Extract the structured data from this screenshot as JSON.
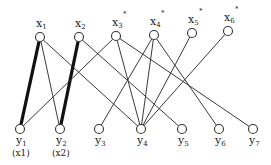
{
  "diagram": {
    "type": "bipartite-graph",
    "top_nodes": [
      {
        "id": "x1",
        "label": "x",
        "sub": "1",
        "x": 40,
        "y": 37,
        "starred": false
      },
      {
        "id": "x2",
        "label": "x",
        "sub": "2",
        "x": 79,
        "y": 37,
        "starred": false
      },
      {
        "id": "x3",
        "label": "x",
        "sub": "3",
        "x": 116,
        "y": 36,
        "starred": true
      },
      {
        "id": "x4",
        "label": "x",
        "sub": "4",
        "x": 154,
        "y": 35,
        "starred": true
      },
      {
        "id": "x5",
        "label": "x",
        "sub": "5",
        "x": 192,
        "y": 33,
        "starred": true
      },
      {
        "id": "x6",
        "label": "x",
        "sub": "6",
        "x": 228,
        "y": 31,
        "starred": true
      }
    ],
    "bottom_nodes": [
      {
        "id": "y1",
        "label": "y",
        "sub": "1",
        "x": 20,
        "y": 129,
        "caption": "(x1)"
      },
      {
        "id": "y2",
        "label": "y",
        "sub": "2",
        "x": 60,
        "y": 129,
        "caption": "(x2)"
      },
      {
        "id": "y3",
        "label": "y",
        "sub": "3",
        "x": 99,
        "y": 129,
        "caption": ""
      },
      {
        "id": "y4",
        "label": "y",
        "sub": "4",
        "x": 141,
        "y": 129,
        "caption": ""
      },
      {
        "id": "y5",
        "label": "y",
        "sub": "5",
        "x": 182,
        "y": 129,
        "caption": ""
      },
      {
        "id": "y6",
        "label": "y",
        "sub": "6",
        "x": 219,
        "y": 129,
        "caption": ""
      },
      {
        "id": "y7",
        "label": "y",
        "sub": "7",
        "x": 253,
        "y": 129,
        "caption": ""
      }
    ],
    "edges": [
      {
        "from": "x1",
        "to": "y1",
        "bold": true
      },
      {
        "from": "x1",
        "to": "y2",
        "bold": false
      },
      {
        "from": "x1",
        "to": "y4",
        "bold": false
      },
      {
        "from": "x2",
        "to": "y2",
        "bold": true
      },
      {
        "from": "x2",
        "to": "y5",
        "bold": false
      },
      {
        "from": "x3",
        "to": "y1",
        "bold": false
      },
      {
        "from": "x3",
        "to": "y4",
        "bold": false
      },
      {
        "from": "x3",
        "to": "y7",
        "bold": false
      },
      {
        "from": "x4",
        "to": "y3",
        "bold": false
      },
      {
        "from": "x4",
        "to": "y4",
        "bold": false
      },
      {
        "from": "x4",
        "to": "y6",
        "bold": false
      },
      {
        "from": "x5",
        "to": "y4",
        "bold": false
      },
      {
        "from": "x6",
        "to": "y4",
        "bold": false
      }
    ],
    "star_symbol": "*",
    "colors": {
      "line": "#3a3a3a",
      "bold_line": "#111111",
      "node_fill": "#ffffff",
      "node_stroke": "#333333"
    }
  }
}
